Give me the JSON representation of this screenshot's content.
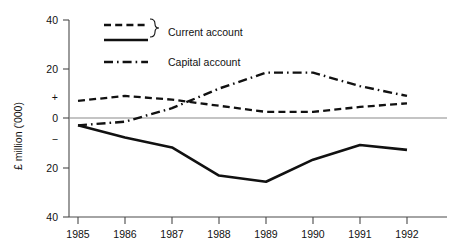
{
  "chart_data": {
    "type": "line",
    "title": "",
    "xlabel": "",
    "ylabel": "£ million ('000)",
    "categories": [
      "1985",
      "1986",
      "1987",
      "1988",
      "1989",
      "1990",
      "1991",
      "1992"
    ],
    "x": [
      1985,
      1986,
      1987,
      1988,
      1989,
      1990,
      1991,
      1992
    ],
    "ylim": [
      -40,
      40
    ],
    "yticks": [
      40,
      20,
      0,
      -20,
      -40
    ],
    "ytick_labels": [
      "40",
      "20",
      "+",
      "0",
      "−",
      "20",
      "40"
    ],
    "grid": false,
    "legend_position": "top-left",
    "series": [
      {
        "name": "Current account",
        "style": "dashed",
        "values": [
          7,
          9,
          7.5,
          5,
          2.5,
          2.5,
          4.5,
          6
        ]
      },
      {
        "name": "Current account",
        "style": "solid",
        "values": [
          -3,
          -8,
          -12,
          -23.5,
          -26,
          -17,
          -11,
          -13
        ]
      },
      {
        "name": "Capital account",
        "style": "dash-dot",
        "values": [
          -3,
          -1.5,
          4,
          12,
          18.5,
          18.5,
          13,
          9
        ]
      }
    ]
  },
  "axes": {
    "y_label": "£ million ('000)",
    "y_ticks": [
      {
        "label": "40",
        "value": 40
      },
      {
        "label": "20",
        "value": 20
      },
      {
        "label": "+",
        "value": 8
      },
      {
        "label": "0",
        "value": 0
      },
      {
        "label": "−",
        "value": -8
      },
      {
        "label": "20",
        "value": -20
      },
      {
        "label": "40",
        "value": -40
      }
    ],
    "x_ticks": [
      "1985",
      "1986",
      "1987",
      "1988",
      "1989",
      "1990",
      "1991",
      "1992"
    ]
  },
  "legend": {
    "entries": [
      {
        "label": "Current account",
        "styles": [
          "dashed",
          "solid"
        ],
        "brace": true
      },
      {
        "label": "Capital account",
        "styles": [
          "dash-dot"
        ],
        "brace": false
      }
    ]
  },
  "colors": {
    "ink": "#111111",
    "axis": "#4a4a4a",
    "zero": "#8a8a8a",
    "background": "#ffffff"
  }
}
